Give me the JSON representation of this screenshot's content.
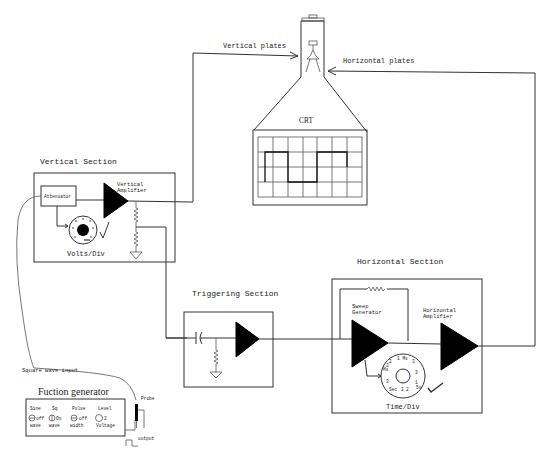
{
  "diagram": {
    "crt": {
      "label": "CRT",
      "vertical_plates_label": "Vertical plates",
      "horizontal_plates_label": "Horizontal plates",
      "grid": {
        "columns": 7,
        "rows": 4
      }
    },
    "vertical_section": {
      "title": "Vertical Section",
      "attenuator_label": "Attenuator",
      "amplifier_label_line1": "Vertical",
      "amplifier_label_line2": "Amplifier",
      "knob_label": "Volts/Div"
    },
    "triggering_section": {
      "title": "Triggering Section"
    },
    "horizontal_section": {
      "title": "Horizontal Section",
      "sweep_label_line1": "Sweep",
      "sweep_label_line2": "Generator",
      "amplifier_label_line1": "Horizontal",
      "amplifier_label_line2": "Amplifier",
      "knob_label": "Time/Div",
      "knob_marks": [
        "1 Ms",
        "2",
        "3",
        "1",
        "5s",
        "2",
        "3",
        "Sec",
        "2",
        "3",
        "Ms",
        "2"
      ]
    },
    "function_generator": {
      "title": "Fuction generator",
      "input_label": "Square wave input",
      "probe_label": "Probe",
      "output_label": "output",
      "controls": [
        {
          "label": "Sine",
          "state": "off",
          "sub": "wave"
        },
        {
          "label": "Sq",
          "state": "On",
          "sub": "wave"
        },
        {
          "label": "Pulse",
          "state": "off",
          "sub": "width"
        },
        {
          "label": "Level",
          "state": "2",
          "sub": "Voltage"
        }
      ]
    }
  }
}
